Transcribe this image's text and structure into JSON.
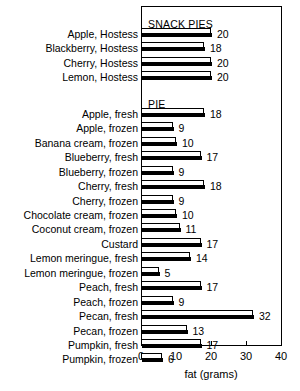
{
  "chart_data": {
    "type": "bar",
    "orientation": "horizontal",
    "title": "",
    "xlabel": "fat (grams)",
    "ylabel": "",
    "xlim": [
      0,
      40
    ],
    "xticks": [
      0,
      10,
      20,
      30,
      40
    ],
    "grid": false,
    "legend": null,
    "groups": [
      {
        "name": "SNACK PIES",
        "categories": [
          "Apple, Hostess",
          "Blackberry, Hostess",
          "Cherry, Hostess",
          "Lemon, Hostess"
        ],
        "values": [
          20,
          18,
          20,
          20
        ]
      },
      {
        "name": "PIE",
        "categories": [
          "Apple, fresh",
          "Apple, frozen",
          "Banana cream, frozen",
          "Blueberry, fresh",
          "Blueberry, frozen",
          "Cherry, fresh",
          "Cherry, frozen",
          "Chocolate cream, frozen",
          "Coconut cream, frozen",
          "Custard",
          "Lemon meringue, fresh",
          "Lemon meringue, frozen",
          "Peach, fresh",
          "Peach, frozen",
          "Pecan, fresh",
          "Pecan, frozen",
          "Pumpkin, fresh",
          "Pumpkin, frozen"
        ],
        "values": [
          18,
          9,
          10,
          17,
          9,
          18,
          9,
          10,
          11,
          17,
          14,
          5,
          17,
          9,
          32,
          13,
          17,
          6
        ]
      }
    ],
    "categories": [
      "Apple, Hostess",
      "Blackberry, Hostess",
      "Cherry, Hostess",
      "Lemon, Hostess",
      "Apple, fresh",
      "Apple, frozen",
      "Banana cream, frozen",
      "Blueberry, fresh",
      "Blueberry, frozen",
      "Cherry, fresh",
      "Cherry, frozen",
      "Chocolate cream, frozen",
      "Coconut cream, frozen",
      "Custard",
      "Lemon meringue, fresh",
      "Lemon meringue, frozen",
      "Peach, fresh",
      "Peach, frozen",
      "Pecan, fresh",
      "Pecan, frozen",
      "Pumpkin, fresh",
      "Pumpkin, frozen"
    ],
    "values": [
      20,
      18,
      20,
      20,
      18,
      9,
      10,
      17,
      9,
      18,
      9,
      10,
      11,
      17,
      14,
      5,
      17,
      9,
      32,
      13,
      17,
      6
    ],
    "colors": {
      "bar_face": "#ffffff",
      "bar_shadow": "#000000",
      "outline": "#000000",
      "background": "#ffffff",
      "text": "#000000"
    }
  },
  "axis": {
    "x_title": "fat (grams)",
    "tick_labels": [
      "0",
      "10",
      "20",
      "30",
      "40"
    ]
  },
  "geometry": {
    "plot_left": 141,
    "plot_right": 281,
    "plot_top": 6,
    "plot_bottom": 345,
    "px_per_unit": 3.5
  }
}
